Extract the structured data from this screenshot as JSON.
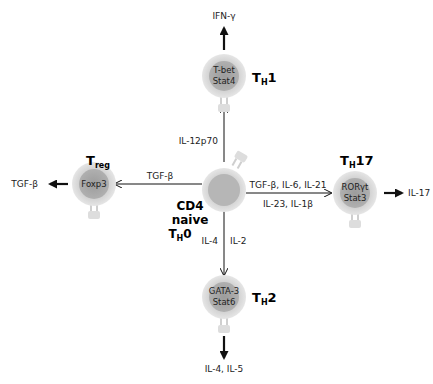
{
  "colors": {
    "cell_outer": "#d9d9d9",
    "cell_inner": "#a9a9a9",
    "center_outer": "#dcdcdc",
    "center_inner": "#b4b4b4",
    "line": "#111111"
  },
  "center": {
    "line1": "CD4",
    "line2": "naive",
    "label_main": "T",
    "label_sub": "H",
    "label_num": "0"
  },
  "th1": {
    "title_main": "T",
    "title_sub": "H",
    "title_num": "1",
    "tf1": "T-bet",
    "tf2": "Stat4",
    "input": "IL-12p70",
    "output": "IFN-γ"
  },
  "treg": {
    "title_main": "T",
    "title_sub": "reg",
    "tf1": "Foxp3",
    "input": "TGF-β",
    "output": "TGF-β"
  },
  "th17": {
    "title_main": "T",
    "title_sub": "H",
    "title_num": "17",
    "tf1": "RORγt",
    "tf2": "Stat3",
    "input1": "TGF-β, IL-6, IL-21",
    "input2": "IL-23, IL-1β",
    "output": "IL-17"
  },
  "th2": {
    "title_main": "T",
    "title_sub": "H",
    "title_num": "2",
    "tf1": "GATA-3",
    "tf2": "Stat6",
    "input1": "IL-4",
    "input2": "IL-2",
    "output": "IL-4, IL-5"
  }
}
